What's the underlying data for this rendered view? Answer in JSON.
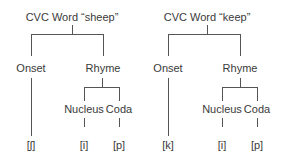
{
  "trees": [
    {
      "title": "CVC Word “sheep”",
      "onset": "Onset",
      "rhyme": "Rhyme",
      "nucleus": "Nucleus",
      "coda": "Coda",
      "onset_leaf": "[ʃ]",
      "nucleus_leaf": "[i]",
      "coda_leaf": "[p]"
    },
    {
      "title": "CVC Word “keep”",
      "onset": "Onset",
      "rhyme": "Rhyme",
      "nucleus": "Nucleus",
      "coda": "Coda",
      "onset_leaf": "[k]",
      "nucleus_leaf": "[i]",
      "coda_leaf": "[p]"
    }
  ],
  "colors": {
    "line": "#555555",
    "text": "#3a3a3a"
  }
}
